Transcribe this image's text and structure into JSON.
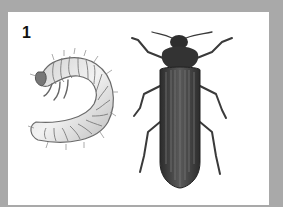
{
  "figure": {
    "panel_label": "1",
    "subjects": [
      "larva-grub",
      "adult-beetle"
    ],
    "colors": {
      "frame": "#a9a9a9",
      "panel": "#ffffff",
      "beetle_body": "#3a3a3a",
      "larva_body": "#d8d8d8"
    }
  }
}
